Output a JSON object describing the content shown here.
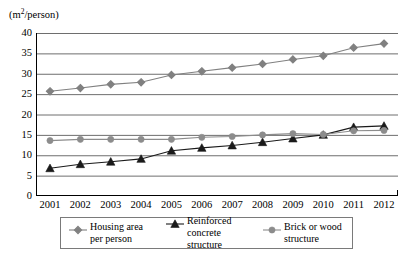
{
  "chart_data": {
    "type": "line",
    "title": "",
    "subtitle": "",
    "xlabel": "",
    "ylabel": "(m2/person)",
    "ylabel_html": "(m²/person)",
    "ylim": [
      0,
      40
    ],
    "ytick_step": 5,
    "yticks": [
      40,
      35,
      30,
      25,
      20,
      15,
      10,
      5,
      0
    ],
    "grid": true,
    "grid_axis": "y",
    "legend_position": "bottom",
    "categories": [
      "2001",
      "2002",
      "2003",
      "2004",
      "2005",
      "2006",
      "2007",
      "2008",
      "2009",
      "2010",
      "2011",
      "2012"
    ],
    "x": [
      2001,
      2002,
      2003,
      2004,
      2005,
      2006,
      2007,
      2008,
      2009,
      2010,
      2011,
      2012
    ],
    "series": [
      {
        "name": "Housing area per person",
        "marker": "diamond",
        "color": "#808080",
        "values": [
          25.7,
          26.5,
          27.4,
          27.9,
          29.7,
          30.6,
          31.5,
          32.4,
          33.5,
          34.4,
          36.4,
          37.4
        ]
      },
      {
        "name": "Reinforced concrete structure",
        "marker": "triangle",
        "color": "#1a1a1a",
        "values": [
          6.8,
          7.8,
          8.4,
          9.1,
          11.1,
          11.8,
          12.4,
          13.2,
          14.1,
          15.0,
          16.9,
          17.2
        ]
      },
      {
        "name": "Brick or wood structure",
        "marker": "circle",
        "color": "#8c8c8c",
        "values": [
          13.6,
          13.9,
          13.9,
          13.9,
          13.9,
          14.4,
          14.6,
          15.0,
          15.3,
          15.1,
          16.0,
          16.1
        ]
      }
    ]
  },
  "legend": {
    "entries": [
      {
        "label": "Housing area\nper person",
        "marker": "diamond-marker-icon"
      },
      {
        "label": "Reinforced\nconcrete structure",
        "marker": "triangle-marker-icon"
      },
      {
        "label": "Brick or wood\nstructure",
        "marker": "circle-marker-icon"
      }
    ]
  },
  "colors": {
    "axis": "#000000",
    "grid": "#6e6e6e",
    "series_housing": "#808080",
    "series_reinforced": "#1a1a1a",
    "series_brick": "#8c8c8c",
    "background": "#ffffff"
  }
}
